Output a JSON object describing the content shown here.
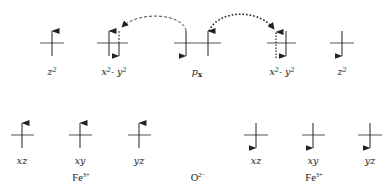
{
  "diagram": {
    "type": "orbital-superexchange",
    "colors": {
      "line": "#333333",
      "text": "#222222",
      "background": "#ffffff"
    },
    "top_row": [
      {
        "id": "fe1-z2",
        "label_main": "z",
        "label_sup": "2",
        "label_rest": "",
        "cx": 52,
        "electrons": [
          "up"
        ]
      },
      {
        "id": "fe1-x2y2",
        "label_main": "x",
        "label_sup": "2",
        "label_rest": "- y",
        "label_sup2": "2",
        "cx": 113,
        "electrons": [
          "up",
          "down-dashed"
        ]
      },
      {
        "id": "o-px",
        "label_main": "p",
        "label_sub": "x",
        "cx": 197,
        "electrons": [
          "down",
          "up"
        ]
      },
      {
        "id": "fe2-x2y2",
        "label_main": "x",
        "label_sup": "2",
        "label_rest": "- y",
        "label_sup2": "2",
        "cx": 282,
        "electrons": [
          "up-dotted",
          "down"
        ]
      },
      {
        "id": "fe2-z2",
        "label_main": "z",
        "label_sup": "2",
        "label_rest": "",
        "cx": 342,
        "electrons": [
          "down"
        ]
      }
    ],
    "bottom_row": [
      {
        "id": "fe1-xz",
        "label": "xz",
        "cx": 22,
        "electrons": [
          "up"
        ]
      },
      {
        "id": "fe1-xy",
        "label": "xy",
        "cx": 80,
        "electrons": [
          "up"
        ]
      },
      {
        "id": "fe1-yz",
        "label": "yz",
        "cx": 139,
        "electrons": [
          "up"
        ]
      },
      {
        "id": "fe2-xz",
        "label": "xz",
        "cx": 256,
        "electrons": [
          "down"
        ]
      },
      {
        "id": "fe2-xy",
        "label": "xy",
        "cx": 313,
        "electrons": [
          "down"
        ]
      },
      {
        "id": "fe2-yz",
        "label": "yz",
        "cx": 370,
        "electrons": [
          "down"
        ]
      }
    ],
    "ions": [
      {
        "id": "fe-left",
        "base": "Fe",
        "charge": "3+",
        "cx": 81
      },
      {
        "id": "oxygen",
        "base": "O",
        "charge": "2−",
        "cx": 197
      },
      {
        "id": "fe-right",
        "base": "Fe",
        "charge": "3+",
        "cx": 313
      }
    ],
    "transfers": [
      {
        "id": "arc-left",
        "style": "dashed",
        "from": "o-px",
        "to": "fe1-x2y2"
      },
      {
        "id": "arc-right",
        "style": "dotted",
        "from": "o-px",
        "to": "fe2-x2y2"
      }
    ]
  },
  "labels": {
    "z2": "z",
    "x2y2_rest": "- y",
    "px_main": "p",
    "px_sub": "x",
    "sup2": "2",
    "xz": "xz",
    "xy": "xy",
    "yz": "yz",
    "fe": "Fe",
    "fe_charge": "3+",
    "o": "O",
    "o_charge": "2−"
  }
}
